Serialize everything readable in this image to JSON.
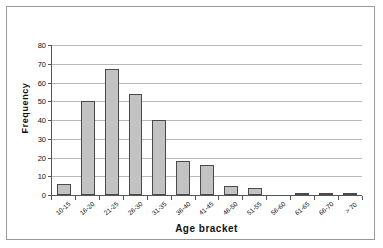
{
  "chart_data": {
    "type": "bar",
    "title": "",
    "xlabel": "Age bracket",
    "ylabel": "Frequency",
    "ylim": [
      0,
      80
    ],
    "ytick_step": 10,
    "yticks": [
      0,
      10,
      20,
      30,
      40,
      50,
      60,
      70,
      80
    ],
    "grid": "horizontal",
    "legend": "none",
    "categories": [
      "10-15",
      "16-20",
      "21-25",
      "26-30",
      "31-35",
      "36-40",
      "41-45",
      "46-50",
      "51-55",
      "56-60",
      "61-65",
      "66-70",
      "> 70"
    ],
    "values": [
      6,
      50,
      67,
      54,
      40,
      18,
      16,
      5,
      4,
      0,
      1,
      1,
      1
    ],
    "series": [
      {
        "name": "Frequency",
        "values": [
          6,
          50,
          67,
          54,
          40,
          18,
          16,
          5,
          4,
          0,
          1,
          1,
          1
        ]
      }
    ],
    "bar_fill_color": "#c3c3c3",
    "bar_border_color": "#4a4a4a",
    "gridline_color": "#b9b9b9",
    "axis_color": "#555555",
    "plot_background": "#ffffff",
    "frame_border_color": "#9a9a9a"
  }
}
